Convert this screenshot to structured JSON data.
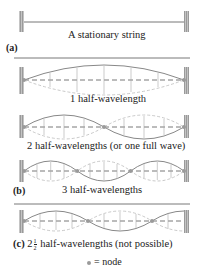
{
  "parts": {
    "a": {
      "letter": "(a)",
      "caption": "A stationary string"
    },
    "b": {
      "letter": "(b)",
      "captions": [
        "1 half-wavelength",
        "2 half-wavelengths (or one full wave)",
        "3 half-wavelengths"
      ]
    },
    "c": {
      "letter": "(c)",
      "whole": "2",
      "num": "1",
      "den": "2",
      "caption": "half-wavelengths (not possible)"
    }
  },
  "legend": {
    "symbol": "●",
    "text": "= node"
  },
  "colors": {
    "string": "#8a8a8a",
    "dashed": "#bdbdbd",
    "axis": "#555555",
    "wall": "#b0b0b0",
    "node": "#9a9a9a"
  }
}
